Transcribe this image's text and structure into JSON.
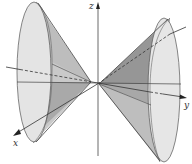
{
  "figure": {
    "axes": {
      "x_label": "x",
      "y_label": "y",
      "z_label": "z"
    },
    "colors": {
      "background": "#ffffff",
      "cone_outer": "#e8e8e8",
      "cone_inner": "#b4b4b4",
      "cone_shadow": "#9a9a9a",
      "ellipse_fill": "#e2e2e2",
      "line": "#3a3a3a"
    }
  }
}
